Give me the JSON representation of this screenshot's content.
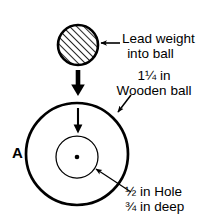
{
  "diagram": {
    "title_letter": "A",
    "labels": {
      "lead_weight_line1": "Lead weight",
      "lead_weight_line2": "into ball",
      "ball_size": "1¼ in",
      "ball_name": "Wooden ball",
      "hole_size": "½ in Hole",
      "hole_depth": "¾ in deep"
    },
    "colors": {
      "stroke": "#000000",
      "background": "#ffffff",
      "hatch": "#000000"
    },
    "shapes": {
      "lead_weight": {
        "cx": 78,
        "cy": 45,
        "r": 20,
        "fill": "hatched"
      },
      "wooden_ball": {
        "cx": 77,
        "cy": 154,
        "r": 51,
        "fill": "none"
      },
      "hole": {
        "cx": 77,
        "cy": 157,
        "r": 21,
        "fill": "none"
      },
      "center_dot": {
        "cx": 77,
        "cy": 157,
        "r": 2.2
      }
    },
    "arrows": {
      "drop_thick": {
        "x": 78,
        "y1": 71,
        "y2": 96
      },
      "drop_thin": {
        "x": 78,
        "y1": 108,
        "y2": 133
      },
      "lead_pointer": {
        "x1": 120,
        "y1": 43,
        "x2": 99,
        "y2": 43
      },
      "ball_pointer": {
        "x1": 131,
        "y1": 96,
        "x2": 117,
        "y2": 113
      },
      "hole_pointer": {
        "x1": 131,
        "y1": 192,
        "x2": 95,
        "y2": 168
      }
    }
  }
}
